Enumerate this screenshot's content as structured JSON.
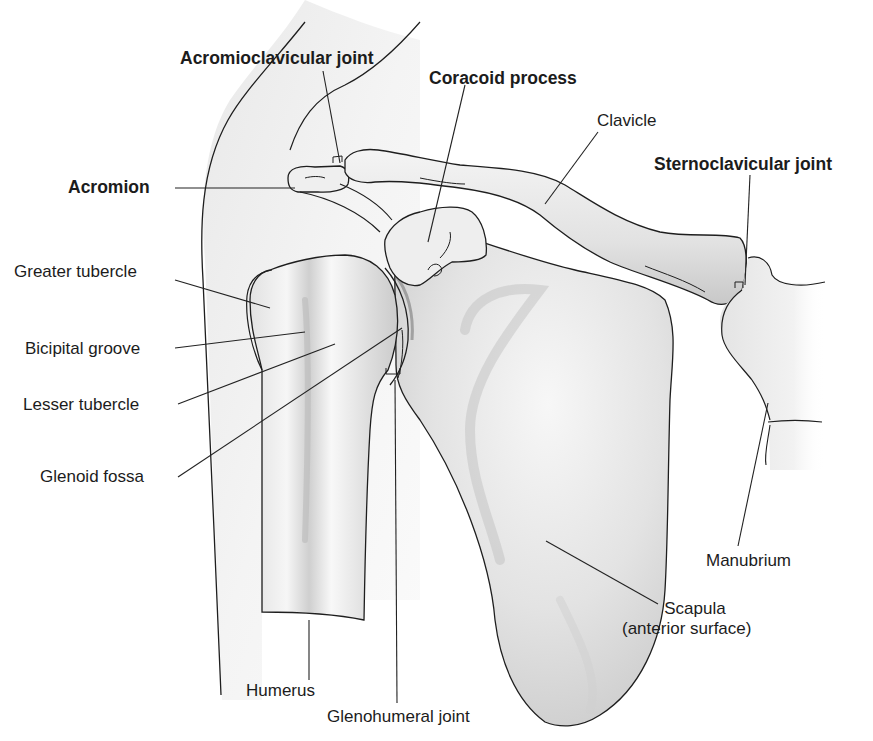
{
  "figure": {
    "colors": {
      "background": "#ffffff",
      "outline": "#1e1e1e",
      "skin_silhouette": "#e6e6e6",
      "bone_light": "#f1f1f1",
      "bone_mid": "#dcdcdc",
      "bone_shadow": "#b9b9b9",
      "leader_line": "#222222"
    }
  },
  "labels": {
    "acromioclavicular_joint": "Acromioclavicular joint",
    "coracoid_process": "Coracoid process",
    "clavicle": "Clavicle",
    "sternoclavicular_joint": "Sternoclavicular joint",
    "acromion": "Acromion",
    "greater_tubercle": "Greater tubercle",
    "bicipital_groove": "Bicipital groove",
    "lesser_tubercle": "Lesser tubercle",
    "glenoid_fossa": "Glenoid fossa",
    "manubrium": "Manubrium",
    "scapula_line1": "Scapula",
    "scapula_line2": "(anterior surface)",
    "humerus": "Humerus",
    "glenohumeral_joint": "Glenohumeral joint"
  },
  "label_styles": {
    "bold": [
      "acromioclavicular_joint",
      "coracoid_process",
      "sternoclavicular_joint",
      "acromion"
    ],
    "regular": [
      "clavicle",
      "greater_tubercle",
      "bicipital_groove",
      "lesser_tubercle",
      "glenoid_fossa",
      "manubrium",
      "scapula_line1",
      "scapula_line2",
      "humerus",
      "glenohumeral_joint"
    ]
  }
}
